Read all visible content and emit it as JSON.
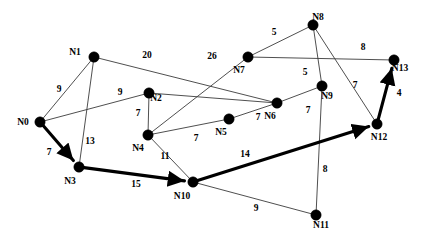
{
  "chart_data": {
    "type": "diagram",
    "title": "",
    "canvas": {
      "width": 440,
      "height": 242,
      "background": "#ffffff"
    },
    "colors": {
      "node_fill": "#000000",
      "edge_stroke": "#3b3b3b",
      "path_stroke": "#000000",
      "label_color": "#000000"
    },
    "nodes": [
      {
        "id": "N0",
        "label": "N0",
        "x": 40,
        "y": 122,
        "r": 5.2,
        "label_dx": -17,
        "label_dy": 3
      },
      {
        "id": "N1",
        "label": "N1",
        "x": 94,
        "y": 57,
        "r": 5.2,
        "label_dx": -19,
        "label_dy": -2
      },
      {
        "id": "N2",
        "label": "N2",
        "x": 149,
        "y": 93,
        "r": 5.2,
        "label_dx": 7,
        "label_dy": 8
      },
      {
        "id": "N3",
        "label": "N3",
        "x": 79,
        "y": 167,
        "r": 5.2,
        "label_dx": -9,
        "label_dy": 17
      },
      {
        "id": "N4",
        "label": "N4",
        "x": 148,
        "y": 135,
        "r": 5.2,
        "label_dx": -10,
        "label_dy": 16
      },
      {
        "id": "N5",
        "label": "N5",
        "x": 229,
        "y": 119,
        "r": 5.2,
        "label_dx": -8,
        "label_dy": 16
      },
      {
        "id": "N6",
        "label": "N6",
        "x": 277,
        "y": 103,
        "r": 5.2,
        "label_dx": -7,
        "label_dy": 16
      },
      {
        "id": "N7",
        "label": "N7",
        "x": 248,
        "y": 57,
        "r": 5.2,
        "label_dx": -9,
        "label_dy": 16
      },
      {
        "id": "N8",
        "label": "N8",
        "x": 313,
        "y": 25,
        "r": 5.2,
        "label_dx": 5,
        "label_dy": -5
      },
      {
        "id": "N9",
        "label": "N9",
        "x": 322,
        "y": 86,
        "r": 5.2,
        "label_dx": 5,
        "label_dy": 13
      },
      {
        "id": "N10",
        "label": "N10",
        "x": 193,
        "y": 182,
        "r": 5.2,
        "label_dx": -11,
        "label_dy": 17
      },
      {
        "id": "N11",
        "label": "N11",
        "x": 316,
        "y": 215,
        "r": 5.2,
        "label_dx": 5,
        "label_dy": 13
      },
      {
        "id": "N12",
        "label": "N12",
        "x": 377,
        "y": 124,
        "r": 5.2,
        "label_dx": 2,
        "label_dy": 16
      },
      {
        "id": "N13",
        "label": "N13",
        "x": 394,
        "y": 60,
        "r": 5.2,
        "label_dx": 6,
        "label_dy": 11
      }
    ],
    "edges": [
      {
        "from": "N0",
        "to": "N1",
        "weight": "9",
        "wx": 59,
        "wy": 92,
        "path": false
      },
      {
        "from": "N0",
        "to": "N2",
        "weight": "9",
        "wx": 120,
        "wy": 95,
        "path": false
      },
      {
        "from": "N0",
        "to": "N3",
        "weight": "7",
        "wx": 49,
        "wy": 155,
        "path": true
      },
      {
        "from": "N1",
        "to": "N3",
        "weight": "13",
        "wx": 90,
        "wy": 144,
        "path": false
      },
      {
        "from": "N1",
        "to": "N6",
        "weight": "20",
        "wx": 147,
        "wy": 58,
        "path": false
      },
      {
        "from": "N2",
        "to": "N4",
        "weight": "7",
        "wx": 138,
        "wy": 116,
        "path": false
      },
      {
        "from": "N2",
        "to": "N6",
        "weight": "",
        "wx": 0,
        "wy": 0,
        "path": false
      },
      {
        "from": "N7",
        "to": "N4",
        "weight": "26",
        "wx": 212,
        "wy": 59,
        "path": false
      },
      {
        "from": "N4",
        "to": "N5",
        "weight": "7",
        "wx": 196,
        "wy": 141,
        "path": false
      },
      {
        "from": "N5",
        "to": "N6",
        "weight": "7",
        "wx": 258,
        "wy": 120,
        "path": false
      },
      {
        "from": "N6",
        "to": "N9",
        "weight": "7",
        "wx": 308,
        "wy": 113,
        "path": false
      },
      {
        "from": "N7",
        "to": "N8",
        "weight": "5",
        "wx": 274,
        "wy": 35,
        "path": false
      },
      {
        "from": "N7",
        "to": "N13",
        "weight": "8",
        "wx": 363,
        "wy": 50,
        "path": false
      },
      {
        "from": "N8",
        "to": "N9",
        "weight": "5",
        "wx": 305,
        "wy": 75,
        "path": false
      },
      {
        "from": "N8",
        "to": "N12",
        "weight": "7",
        "wx": 355,
        "wy": 88,
        "path": false
      },
      {
        "from": "N9",
        "to": "N11",
        "weight": "8",
        "wx": 325,
        "wy": 172,
        "path": false
      },
      {
        "from": "N4",
        "to": "N10",
        "weight": "11",
        "wx": 165,
        "wy": 159,
        "path": false
      },
      {
        "from": "N3",
        "to": "N10",
        "weight": "15",
        "wx": 136,
        "wy": 187,
        "path": true
      },
      {
        "from": "N10",
        "to": "N12",
        "weight": "14",
        "wx": 245,
        "wy": 157,
        "path": true
      },
      {
        "from": "N10",
        "to": "N11",
        "weight": "9",
        "wx": 256,
        "wy": 211,
        "path": false
      },
      {
        "from": "N12",
        "to": "N13",
        "weight": "4",
        "wx": 399,
        "wy": 96,
        "path": true
      }
    ],
    "highlighted_path": {
      "sequence": [
        "N0",
        "N3",
        "N10",
        "N12",
        "N13"
      ],
      "total_weight": 40,
      "style": "bold-arrows"
    }
  }
}
